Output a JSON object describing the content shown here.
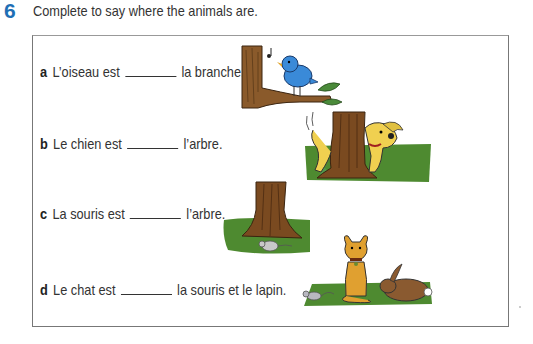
{
  "exercise": {
    "number": "6",
    "instruction": "Complete to say where the animals are.",
    "accent_color": "#1f6fb5"
  },
  "items": [
    {
      "letter": "a",
      "before": "L’oiseau est",
      "after": "la branche.",
      "illustration": "bird-on-branch"
    },
    {
      "letter": "b",
      "before": "Le chien est",
      "after": "l’arbre.",
      "illustration": "dog-behind-tree"
    },
    {
      "letter": "c",
      "before": "La souris est",
      "after": "l’arbre.",
      "illustration": "mouse-in-front-of-tree"
    },
    {
      "letter": "d",
      "before": "Le chat est",
      "after": "la souris et le lapin.",
      "illustration": "cat-between-mouse-and-rabbit"
    }
  ]
}
